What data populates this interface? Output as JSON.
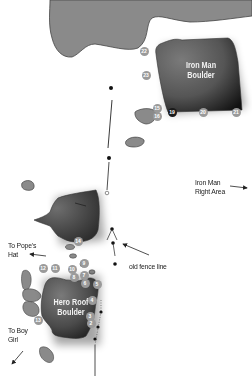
{
  "boulders": [
    {
      "id": "iron-man",
      "name_line1": "Iron Man",
      "name_line2": "Boulder"
    },
    {
      "id": "hero-roof",
      "name_line1": "Hero Roof",
      "name_line2": "Boulder"
    }
  ],
  "labels": {
    "iron_man_right_line1": "Iron Man",
    "iron_man_right_line2": "Right Area",
    "popes_hat_line1": "To Pope's",
    "popes_hat_line2": "Hat",
    "fence": "old fence line",
    "boy_girl_line1": "To Boy",
    "boy_girl_line2": "Girl"
  },
  "problems": [
    {
      "n": "22",
      "x": 144,
      "y": 51,
      "style": "light"
    },
    {
      "n": "23",
      "x": 146,
      "y": 75,
      "style": "light"
    },
    {
      "n": "15",
      "x": 157,
      "y": 108,
      "style": "light"
    },
    {
      "n": "16",
      "x": 157,
      "y": 116,
      "style": "light"
    },
    {
      "n": "19",
      "x": 172,
      "y": 112,
      "style": "dark"
    },
    {
      "n": "20",
      "x": 203,
      "y": 112,
      "style": "light"
    },
    {
      "n": "21",
      "x": 236,
      "y": 112,
      "style": "light"
    },
    {
      "n": "12",
      "x": 43,
      "y": 268,
      "style": "light"
    },
    {
      "n": "11",
      "x": 55,
      "y": 268,
      "style": "light"
    },
    {
      "n": "10",
      "x": 72,
      "y": 269,
      "style": "light"
    },
    {
      "n": "9",
      "x": 84,
      "y": 263,
      "style": "light"
    },
    {
      "n": "8",
      "x": 74,
      "y": 277,
      "style": "light"
    },
    {
      "n": "7",
      "x": 84,
      "y": 275,
      "style": "light"
    },
    {
      "n": "6",
      "x": 85,
      "y": 283,
      "style": "light"
    },
    {
      "n": "5",
      "x": 97,
      "y": 284,
      "style": "light"
    },
    {
      "n": "4",
      "x": 92,
      "y": 300,
      "style": "light"
    },
    {
      "n": "3",
      "x": 90,
      "y": 316,
      "style": "light"
    },
    {
      "n": "2",
      "x": 91,
      "y": 323,
      "style": "light"
    },
    {
      "n": "13",
      "x": 38,
      "y": 320,
      "style": "light"
    },
    {
      "n": "14",
      "x": 78,
      "y": 241,
      "style": "light"
    }
  ],
  "colors": {
    "rock": "#8a8a8a",
    "rock_outline": "#444444",
    "boulder_dark": "#2a2a2a",
    "boulder_mid": "#6a6a6a",
    "background": "#ffffff"
  }
}
